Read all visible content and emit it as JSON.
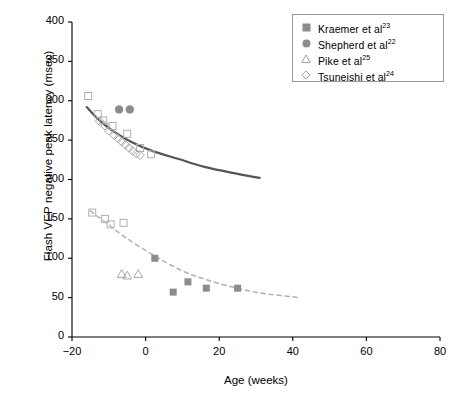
{
  "chart_data": {
    "type": "scatter",
    "title": "",
    "xlabel": "Age (weeks)",
    "ylabel": "Flash VEP negative peak latency (msec)",
    "xlim": [
      -20,
      80
    ],
    "ylim": [
      0,
      400
    ],
    "xticks": [
      -20,
      0,
      20,
      40,
      60,
      80
    ],
    "yticks": [
      0,
      50,
      100,
      150,
      200,
      250,
      300,
      350,
      400
    ],
    "xtick_labels": [
      "−20",
      "0",
      "20",
      "40",
      "60",
      "80"
    ],
    "ytick_labels": [
      "0",
      "50",
      "100",
      "150",
      "200",
      "250",
      "300",
      "350",
      "400"
    ],
    "grid": false,
    "legend_position": "top-right",
    "series": [
      {
        "name": "Kraemer et al",
        "ref": "23",
        "marker": "filled-square",
        "color": "#8c8c8c",
        "points": [
          {
            "x": -15.6,
            "y": 306
          },
          {
            "x": -13.0,
            "y": 283
          },
          {
            "x": -11.5,
            "y": 275
          },
          {
            "x": -9.0,
            "y": 268
          },
          {
            "x": -5.0,
            "y": 258
          },
          {
            "x": -1.5,
            "y": 240
          },
          {
            "x": 1.5,
            "y": 232
          },
          {
            "x": -14.5,
            "y": 158
          },
          {
            "x": -11.0,
            "y": 150
          },
          {
            "x": -9.5,
            "y": 143
          },
          {
            "x": -6.0,
            "y": 145
          },
          {
            "x": 2.5,
            "y": 100
          },
          {
            "x": 7.5,
            "y": 57
          },
          {
            "x": 11.5,
            "y": 70
          },
          {
            "x": 16.5,
            "y": 62
          },
          {
            "x": 25.0,
            "y": 62
          }
        ]
      },
      {
        "name": "Shepherd et al",
        "ref": "22",
        "marker": "filled-circle",
        "color": "#8c8c8c",
        "points": [
          {
            "x": -7.2,
            "y": 289
          },
          {
            "x": -4.3,
            "y": 289
          }
        ]
      },
      {
        "name": "Pike et al",
        "ref": "25",
        "marker": "open-triangle",
        "color": "#a9a9a9",
        "points": [
          {
            "x": -6.5,
            "y": 80
          },
          {
            "x": -5.0,
            "y": 78
          },
          {
            "x": -2.0,
            "y": 80
          }
        ]
      },
      {
        "name": "Tsuneishi et al",
        "ref": "24",
        "marker": "open-diamond",
        "color": "#a9a9a9",
        "points": [
          {
            "x": -12.5,
            "y": 274
          },
          {
            "x": -11.0,
            "y": 268
          },
          {
            "x": -10.0,
            "y": 262
          },
          {
            "x": -8.5,
            "y": 256
          },
          {
            "x": -7.5,
            "y": 252
          },
          {
            "x": -6.5,
            "y": 248
          },
          {
            "x": -5.5,
            "y": 244
          },
          {
            "x": -4.5,
            "y": 240
          },
          {
            "x": -3.5,
            "y": 236
          },
          {
            "x": -2.5,
            "y": 233
          },
          {
            "x": -1.5,
            "y": 231
          }
        ]
      }
    ],
    "trend_lines": [
      {
        "name": "preterm-fit",
        "style": "solid",
        "color": "#555555",
        "width": 2.2,
        "points": [
          {
            "x": -16.0,
            "y": 292
          },
          {
            "x": -13.0,
            "y": 277
          },
          {
            "x": -9.0,
            "y": 262
          },
          {
            "x": -4.0,
            "y": 248
          },
          {
            "x": 2.0,
            "y": 236
          },
          {
            "x": 9.0,
            "y": 226
          },
          {
            "x": 16.0,
            "y": 216
          },
          {
            "x": 24.0,
            "y": 208
          },
          {
            "x": 31.0,
            "y": 202
          }
        ]
      },
      {
        "name": "term-fit",
        "style": "dashed",
        "color": "#b4b4b4",
        "width": 1.6,
        "points": [
          {
            "x": -15.0,
            "y": 160
          },
          {
            "x": -11.0,
            "y": 146
          },
          {
            "x": -6.0,
            "y": 128
          },
          {
            "x": 0.0,
            "y": 110
          },
          {
            "x": 5.0,
            "y": 96
          },
          {
            "x": 11.0,
            "y": 82
          },
          {
            "x": 17.0,
            "y": 72
          },
          {
            "x": 24.0,
            "y": 63
          },
          {
            "x": 31.0,
            "y": 56
          },
          {
            "x": 38.0,
            "y": 52
          },
          {
            "x": 42.0,
            "y": 50
          }
        ]
      }
    ]
  },
  "axes": {
    "xlabel": "Age (weeks)",
    "ylabel": "Flash VEP negative peak latency (msec)"
  },
  "legend": {
    "items": [
      {
        "label": "Kraemer et al",
        "ref": "23",
        "marker": "filled-square"
      },
      {
        "label": "Shepherd et al",
        "ref": "22",
        "marker": "filled-circle"
      },
      {
        "label": "Pike et al",
        "ref": "25",
        "marker": "open-triangle"
      },
      {
        "label": "Tsuneishi et al",
        "ref": "24",
        "marker": "open-diamond"
      }
    ]
  }
}
